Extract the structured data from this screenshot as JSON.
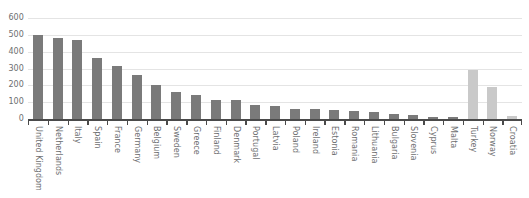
{
  "chart_data": {
    "type": "bar",
    "title": "",
    "subtitle": "",
    "xlabel": "",
    "ylabel": "",
    "ylim": [
      0,
      600
    ],
    "yticks": [
      0,
      100,
      200,
      300,
      400,
      500,
      600
    ],
    "ytick_labels": [
      "0",
      "100",
      "200",
      "300",
      "400",
      "500",
      "600"
    ],
    "grid": "horizontal",
    "legend": "none",
    "categories": [
      "United Kingdom",
      "Netherlands",
      "Italy",
      "Spain",
      "France",
      "Germany",
      "Belgium",
      "Sweden",
      "Greece",
      "Finland",
      "Denmark",
      "Portugal",
      "Latvia",
      "Poland",
      "Ireland",
      "Estonia",
      "Romania",
      "Lithuania",
      "Bulgaria",
      "Slovenia",
      "Cyprus",
      "Malta",
      "Turkey",
      "Norway",
      "Croatia"
    ],
    "values": [
      500,
      483,
      470,
      360,
      312,
      262,
      200,
      160,
      140,
      112,
      110,
      85,
      78,
      60,
      58,
      52,
      50,
      42,
      32,
      25,
      12,
      10,
      290,
      192,
      18
    ],
    "bar_colors": [
      "dark",
      "dark",
      "dark",
      "dark",
      "dark",
      "dark",
      "dark",
      "dark",
      "dark",
      "dark",
      "dark",
      "dark",
      "dark",
      "dark",
      "dark",
      "dark",
      "dark",
      "dark",
      "dark",
      "dark",
      "dark",
      "dark",
      "light",
      "light",
      "light"
    ],
    "colors": {
      "bar_dark": "#7a7a7a",
      "bar_light": "#c9c9c9",
      "gridline": "#e4e4e4",
      "axis": "#4a4a4a",
      "tick_text": "#6d6e70",
      "background": "#ffffff"
    }
  }
}
